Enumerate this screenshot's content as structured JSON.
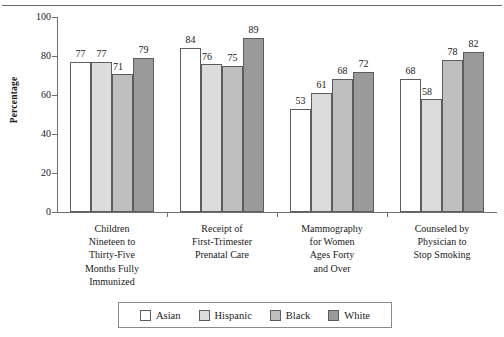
{
  "chart_data": {
    "type": "bar",
    "title": "",
    "xlabel": "",
    "ylabel": "Percentage",
    "ylim": [
      0,
      100
    ],
    "yticks": [
      0,
      20,
      40,
      60,
      80,
      100
    ],
    "grid": false,
    "legend_position": "bottom",
    "categories": [
      "Children Nineteen to Thirty-Five Months Fully Immunized",
      "Receipt of First-Trimester Prenatal Care",
      "Mammography for Women Ages Forty and Over",
      "Counseled by Physician to Stop Smoking"
    ],
    "category_lines": [
      [
        "Children",
        "Nineteen to",
        "Thirty-Five",
        "Months Fully",
        "Immunized"
      ],
      [
        "Receipt of",
        "First-Trimester",
        "Prenatal Care"
      ],
      [
        "Mammography",
        "for Women",
        "Ages Forty",
        "and Over"
      ],
      [
        "Counseled by",
        "Physician to",
        "Stop Smoking"
      ]
    ],
    "series": [
      {
        "name": "Asian",
        "color": "#ffffff",
        "values": [
          77,
          84,
          53,
          68
        ]
      },
      {
        "name": "Hispanic",
        "color": "#dcdcdc",
        "values": [
          77,
          76,
          61,
          58
        ]
      },
      {
        "name": "Black",
        "color": "#bfbfbf",
        "values": [
          71,
          75,
          68,
          78
        ]
      },
      {
        "name": "White",
        "color": "#9a9a9a",
        "values": [
          79,
          89,
          72,
          82
        ]
      }
    ]
  },
  "legend": {
    "items": [
      {
        "label": "Asian"
      },
      {
        "label": "Hispanic"
      },
      {
        "label": "Black"
      },
      {
        "label": "White"
      }
    ]
  },
  "axis": {
    "y_title": "Percentage",
    "y_tick_labels": [
      "0",
      "20",
      "40",
      "60",
      "80",
      "100"
    ]
  }
}
